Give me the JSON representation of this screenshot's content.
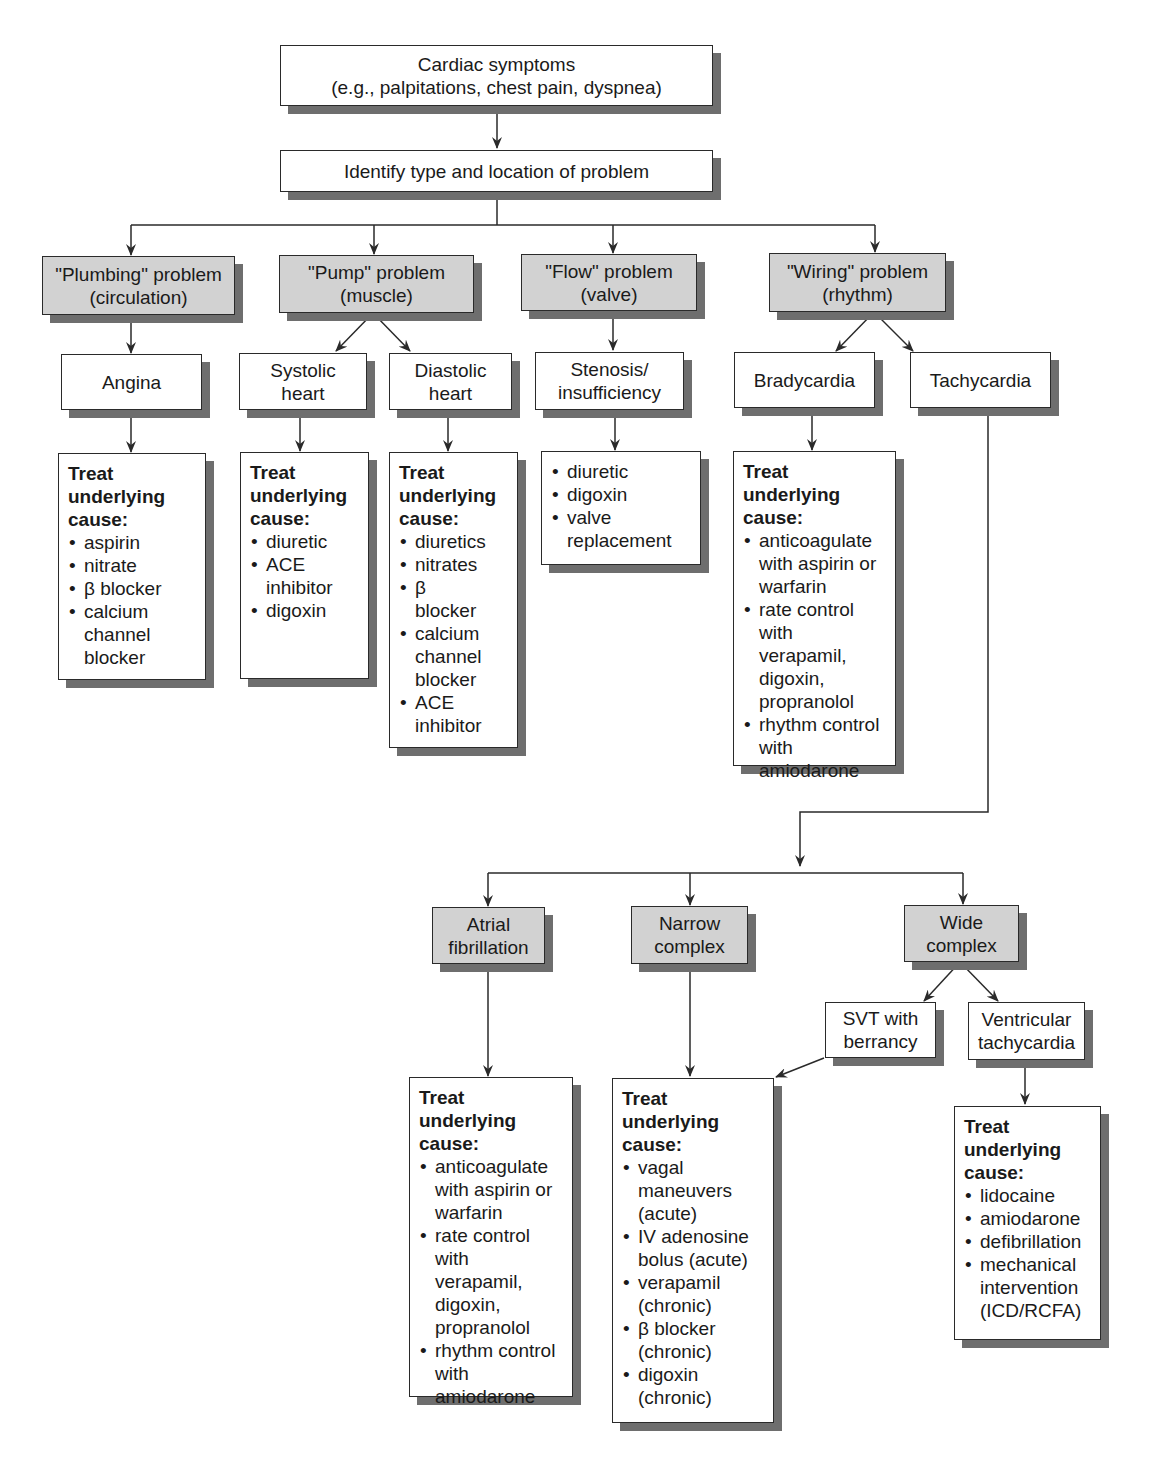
{
  "flowchart": {
    "root": {
      "line1": "Cardiac symptoms",
      "line2": "(e.g., palpitations, chest pain, dyspnea)"
    },
    "identify": {
      "label": "Identify type and location of problem"
    },
    "categories": [
      {
        "id": "plumbing",
        "line1": "\"Plumbing\" problem",
        "line2": "(circulation)"
      },
      {
        "id": "pump",
        "line1": "\"Pump\" problem",
        "line2": "(muscle)"
      },
      {
        "id": "flow",
        "line1": "\"Flow\" problem",
        "line2": "(valve)"
      },
      {
        "id": "wiring",
        "line1": "\"Wiring\" problem",
        "line2": "(rhythm)"
      }
    ],
    "conditions": {
      "angina": {
        "line1": "Angina"
      },
      "systolic": {
        "line1": "Systolic",
        "line2": "heart"
      },
      "diastolic": {
        "line1": "Diastolic",
        "line2": "heart"
      },
      "stenosis": {
        "line1": "Stenosis/",
        "line2": "insufficiency"
      },
      "bradycardia": {
        "line1": "Bradycardia"
      },
      "tachycardia": {
        "line1": "Tachycardia"
      }
    },
    "tachy_types": {
      "afib": {
        "line1": "Atrial",
        "line2": "fibrillation"
      },
      "narrow": {
        "line1": "Narrow",
        "line2": "complex"
      },
      "wide": {
        "line1": "Wide",
        "line2": "complex"
      },
      "svt": {
        "line1": "SVT with",
        "line2": "berrancy"
      },
      "vt": {
        "line1": "Ventricular",
        "line2": "tachycardia"
      }
    },
    "treat_heading": {
      "line1": "Treat",
      "line2": "underlying",
      "line3": "cause:"
    },
    "treatments": {
      "angina": [
        "aspirin",
        "nitrate",
        "β blocker",
        "calcium channel blocker"
      ],
      "systolic": [
        "diuretic",
        "ACE inhibitor",
        "digoxin"
      ],
      "diastolic": [
        "diuretics",
        "nitrates",
        "β blocker",
        "calcium channel blocker",
        "ACE inhibitor"
      ],
      "stenosis": [
        "diuretic",
        "digoxin",
        "valve replacement"
      ],
      "bradycardia": [
        "anticoagulate with aspirin or warfarin",
        "rate control with verapamil, digoxin, propranolol",
        "rhythm control with amiodarone"
      ],
      "afib": [
        "anticoagulate with aspirin or warfarin",
        "rate control with verapamil, digoxin, propranolol",
        "rhythm control with amiodarone"
      ],
      "narrow": [
        "vagal maneuvers (acute)",
        "IV adenosine bolus (acute)",
        "verapamil (chronic)",
        "β blocker (chronic)",
        "digoxin (chronic)"
      ],
      "vt": [
        "lidocaine",
        "amiodarone",
        "defibrillation",
        "mechanical intervention (ICD/RCFA)"
      ]
    },
    "colors": {
      "category_fill": "#d2d2d2",
      "box_fill": "#ffffff",
      "shadow": "#6e6e6e",
      "line": "#2a2a2a"
    }
  }
}
